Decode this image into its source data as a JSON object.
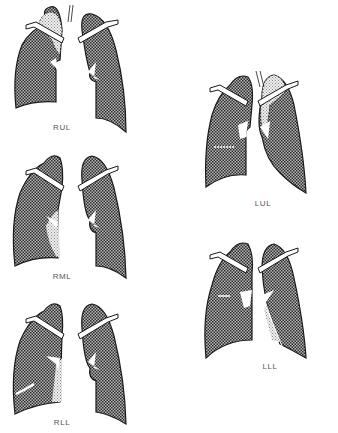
{
  "figure": {
    "colors": {
      "lung_fill": "#8a8a8a",
      "collapsed_lobe_fill": "#d6d6d6",
      "outline": "#1a1a1a",
      "background": "#ffffff"
    },
    "panels": [
      {
        "id": "rul",
        "label": "RUL",
        "side": "right",
        "lobe": "upper"
      },
      {
        "id": "rml",
        "label": "RML",
        "side": "right",
        "lobe": "middle"
      },
      {
        "id": "rll",
        "label": "RLL",
        "side": "right",
        "lobe": "lower"
      },
      {
        "id": "lul",
        "label": "LUL",
        "side": "left",
        "lobe": "upper"
      },
      {
        "id": "lll",
        "label": "LLL",
        "side": "left",
        "lobe": "lower"
      }
    ]
  }
}
